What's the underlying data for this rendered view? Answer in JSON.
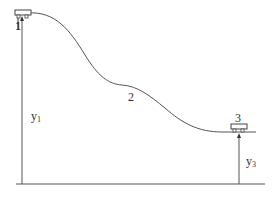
{
  "diagram": {
    "type": "roller-coaster-track-profile",
    "colors": {
      "stroke": "#555555",
      "text": "#333333",
      "background": "#ffffff"
    },
    "points": [
      {
        "id": "1",
        "label": "1"
      },
      {
        "id": "2",
        "label": "2"
      },
      {
        "id": "3",
        "label": "3"
      }
    ],
    "heights": [
      {
        "id": "y1",
        "symbol": "y",
        "subscript": "1"
      },
      {
        "id": "y3",
        "symbol": "y",
        "subscript": "3"
      }
    ],
    "elements": {
      "cart_icons": [
        "cart-at-point-1",
        "cart-at-point-3"
      ],
      "ground_line": "baseline"
    }
  }
}
